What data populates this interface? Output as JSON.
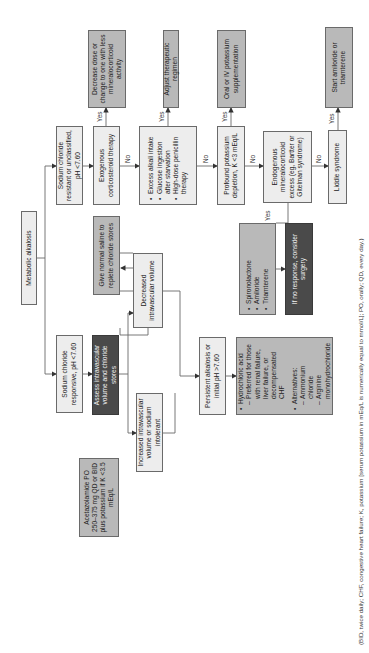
{
  "diagram": {
    "title": "Metabolic alkalosis",
    "colors": {
      "light_box": "#ededed",
      "mid_box": "#b9b9b9",
      "dark_box": "#4a4a4a",
      "line": "#6a6a6a"
    },
    "nodes": {
      "root": "Metabolic alkalosis",
      "nacl_resistant": "Sodium chloride resistant or unclassified, pH <7.60",
      "nacl_responsive": "Sodium chloride responsive, pH <7.60",
      "exogenous_corticosteroid": "Exogenous corticosteroid therapy",
      "decrease_dose": "Decrease dose or change to one with less mineralocorticoid activity",
      "assess_volume": "Assess intravascular volume and chloride stores",
      "give_saline": "Give normal saline to replete chloride stores",
      "increased_volume": "Increased intravascular volume or sodium intolerant",
      "decreased_volume": "Decreased intravascular volume",
      "acetazolamide": "Acetazolamide PO 250–375 mg QD or BID plus potassium if K <3.5 mEq/L",
      "excess_alkali": {
        "items": [
          "Excess alkali intake",
          "Glucose ingestion after starvation",
          "High-dose penicillin therapy"
        ]
      },
      "adjust_regimen": "Adjust therapeutic regimen",
      "persistent_alkalosis": "Persistent alkalosis or initial pH >7.60",
      "hydrochloric_acid": {
        "item1": "Hydrochloric acid",
        "item1_sub": "Preferred for those with renal failure, liver failure, or decompensated CHF",
        "item2": "Alternatives:",
        "item2_sub1": "Ammonium chloride",
        "item2_sub2": "Arginine monohydrochloride"
      },
      "profound_potassium": "Profound potassium depletion, K <3 mEq/L",
      "oral_iv_potassium": "Oral or IV potassium supplementation",
      "endogenous_mineralocorticoid": "Endogenous mineralocorticoid excess (eg, Bartter or Gitelman syndrome)",
      "liddle": "Liddle syndrome",
      "start_amiloride": "Start amiloride or triamterene",
      "diuretics": {
        "items": [
          "Spironolactone",
          "Amiloride",
          "Triamterene"
        ]
      },
      "no_response": "If no response, consider surgery"
    },
    "edge_labels": {
      "yes": "Yes",
      "no": "No"
    },
    "footnote": "(BID, twice daily; CHF, congestive heart failure; K, potassium [serum potassium in mEq/L is numerically equal to mmol/L]; PO, orally; QD, every day.)"
  }
}
